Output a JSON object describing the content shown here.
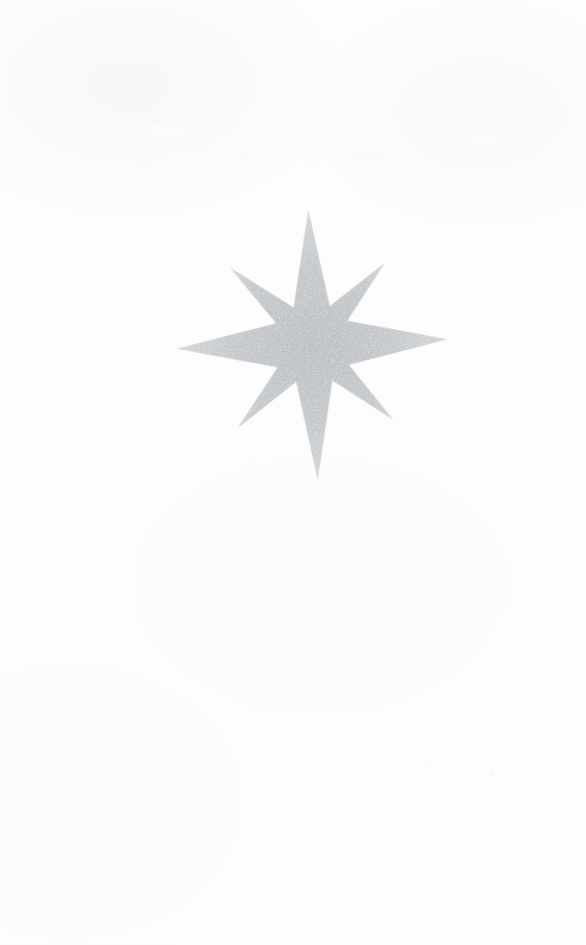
{
  "page": {
    "width": 586,
    "height": 945,
    "background_color": "#fdfdfd",
    "paper_tone": "near-white scanned paper",
    "visible_text": "",
    "notes_label": ""
  },
  "figure": {
    "name": "eight-pointed star",
    "alt_names": [
      "compass rose",
      "sparkle",
      "star burst"
    ],
    "fill_color": "#b9bdc1",
    "fill_color_light": "#d6d9dc",
    "fill_color_dark": "#a8acb1",
    "texture": "stippled grainy halftone",
    "point_count": 8,
    "rotation_degrees": -2,
    "center": {
      "x": 313,
      "y": 344
    },
    "tips": [
      {
        "name": "north",
        "x": 313,
        "y": 210,
        "kind": "cardinal"
      },
      {
        "name": "northeast",
        "x": 395,
        "y": 272,
        "kind": "diagonal"
      },
      {
        "name": "east",
        "x": 447,
        "y": 344,
        "kind": "cardinal"
      },
      {
        "name": "southeast",
        "x": 390,
        "y": 410,
        "kind": "diagonal"
      },
      {
        "name": "south",
        "x": 313,
        "y": 480,
        "kind": "cardinal"
      },
      {
        "name": "southwest",
        "x": 230,
        "y": 405,
        "kind": "diagonal"
      },
      {
        "name": "west",
        "x": 177,
        "y": 344,
        "kind": "cardinal"
      },
      {
        "name": "northwest",
        "x": 230,
        "y": 268,
        "kind": "diagonal"
      }
    ],
    "bounding_box": {
      "left": 177,
      "top": 210,
      "right": 447,
      "bottom": 480
    }
  },
  "ghost_marks": {
    "description": "illegible faint bleed-through from reverse side of page",
    "legible": false,
    "color": "#fafafb",
    "regions": [
      {
        "x": 62,
        "y": 124,
        "width": 96,
        "height": 9
      },
      {
        "x": 70,
        "y": 134,
        "width": 72,
        "height": 8
      },
      {
        "x": 150,
        "y": 126,
        "width": 34,
        "height": 8
      },
      {
        "x": 168,
        "y": 136,
        "width": 18,
        "height": 7
      },
      {
        "x": 196,
        "y": 123,
        "width": 26,
        "height": 9
      },
      {
        "x": 258,
        "y": 125,
        "width": 52,
        "height": 9
      },
      {
        "x": 316,
        "y": 122,
        "width": 16,
        "height": 10
      },
      {
        "x": 338,
        "y": 124,
        "width": 42,
        "height": 9
      },
      {
        "x": 348,
        "y": 136,
        "width": 14,
        "height": 8
      },
      {
        "x": 396,
        "y": 136,
        "width": 16,
        "height": 7
      },
      {
        "x": 462,
        "y": 122,
        "width": 44,
        "height": 11
      },
      {
        "x": 470,
        "y": 134,
        "width": 30,
        "height": 9
      },
      {
        "x": 522,
        "y": 125,
        "width": 12,
        "height": 8
      },
      {
        "x": 136,
        "y": 156,
        "width": 22,
        "height": 7
      },
      {
        "x": 166,
        "y": 152,
        "width": 20,
        "height": 9
      },
      {
        "x": 196,
        "y": 157,
        "width": 10,
        "height": 6
      },
      {
        "x": 236,
        "y": 152,
        "width": 14,
        "height": 9
      },
      {
        "x": 268,
        "y": 153,
        "width": 26,
        "height": 8
      },
      {
        "x": 306,
        "y": 154,
        "width": 14,
        "height": 8
      },
      {
        "x": 346,
        "y": 152,
        "width": 36,
        "height": 9
      },
      {
        "x": 352,
        "y": 164,
        "width": 28,
        "height": 8
      },
      {
        "x": 462,
        "y": 156,
        "width": 20,
        "height": 8
      },
      {
        "x": 486,
        "y": 154,
        "width": 24,
        "height": 9
      }
    ],
    "specks": [
      {
        "x": 491,
        "y": 773,
        "size": 3
      },
      {
        "x": 176,
        "y": 580,
        "size": 2
      },
      {
        "x": 182,
        "y": 718,
        "size": 3
      },
      {
        "x": 430,
        "y": 760,
        "size": 2
      }
    ]
  }
}
